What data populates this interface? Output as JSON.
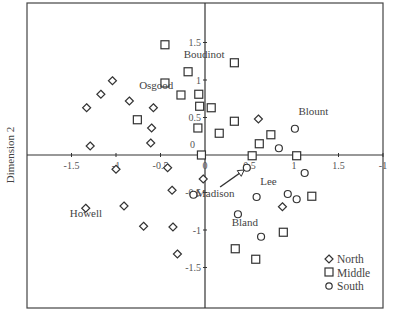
{
  "chart_data": {
    "type": "scatter",
    "title": "",
    "xlabel": "",
    "ylabel": "Dimension 2",
    "xlim": [
      -2,
      2
    ],
    "ylim": [
      -2,
      2
    ],
    "grid": false,
    "axes_through_origin": true,
    "x_ticks": [
      "-1.5",
      "-1",
      "-0.5",
      "0",
      "0.5",
      "1",
      "1.5",
      "-1"
    ],
    "x_tick_values": [
      -1.5,
      -1,
      -0.5,
      0,
      0.5,
      1,
      1.5,
      2
    ],
    "y_ticks": [
      "1.5",
      "1",
      "0.5",
      "0",
      "-0.5",
      "-1",
      "-1.5"
    ],
    "y_tick_values": [
      1.5,
      1,
      0.5,
      0,
      -0.5,
      -1,
      -1.5
    ],
    "legend_position": "lower right",
    "series": [
      {
        "name": "North",
        "marker": "diamond",
        "points": [
          [
            -1.04,
            0.99
          ],
          [
            -1.17,
            0.81
          ],
          [
            -1.33,
            0.63
          ],
          [
            -0.85,
            0.72
          ],
          [
            -0.58,
            0.63
          ],
          [
            -0.6,
            0.36
          ],
          [
            -0.61,
            0.16
          ],
          [
            -1.29,
            0.12
          ],
          [
            0.6,
            0.48
          ],
          [
            -1.0,
            -0.19
          ],
          [
            -0.42,
            -0.17
          ],
          [
            -0.02,
            -0.32
          ],
          [
            -0.37,
            -0.47
          ],
          [
            -1.34,
            -0.71
          ],
          [
            -0.91,
            -0.68
          ],
          [
            -0.69,
            -0.95
          ],
          [
            -0.36,
            -0.96
          ],
          [
            -0.31,
            -1.32
          ],
          [
            0.87,
            -0.69
          ]
        ]
      },
      {
        "name": "Middle",
        "marker": "square",
        "points": [
          [
            -0.45,
            1.47
          ],
          [
            -0.19,
            1.11
          ],
          [
            -0.45,
            0.96
          ],
          [
            -0.27,
            0.8
          ],
          [
            -0.07,
            0.81
          ],
          [
            -0.06,
            0.65
          ],
          [
            0.07,
            0.63
          ],
          [
            0.33,
            1.23
          ],
          [
            0.33,
            0.45
          ],
          [
            -0.08,
            0.36
          ],
          [
            0.16,
            0.29
          ],
          [
            -0.76,
            0.47
          ],
          [
            -0.04,
            0.0
          ],
          [
            0.53,
            -0.01
          ],
          [
            1.03,
            -0.01
          ],
          [
            0.74,
            0.27
          ],
          [
            0.61,
            0.15
          ],
          [
            1.2,
            -0.55
          ],
          [
            0.88,
            -1.03
          ],
          [
            0.34,
            -1.25
          ],
          [
            0.57,
            -1.39
          ]
        ]
      },
      {
        "name": "South",
        "marker": "circle",
        "points": [
          [
            1.01,
            0.35
          ],
          [
            0.83,
            0.09
          ],
          [
            1.12,
            -0.24
          ],
          [
            0.47,
            -0.17
          ],
          [
            -0.13,
            -0.53
          ],
          [
            0.58,
            -0.56
          ],
          [
            0.93,
            -0.52
          ],
          [
            1.03,
            -0.59
          ],
          [
            0.37,
            -0.79
          ],
          [
            0.63,
            -1.09
          ]
        ]
      }
    ],
    "annotations": [
      {
        "text": "Boudinot",
        "x": -0.24,
        "y": 1.3
      },
      {
        "text": "Osgood",
        "x": -0.74,
        "y": 0.88
      },
      {
        "text": "Blount",
        "x": 1.05,
        "y": 0.53
      },
      {
        "text": "Madison",
        "x": -0.1,
        "y": -0.56,
        "arrow_to": [
          0.44,
          -0.2
        ]
      },
      {
        "text": "Lee",
        "x": 0.62,
        "y": -0.4
      },
      {
        "text": "Bland",
        "x": 0.3,
        "y": -0.95
      },
      {
        "text": "Howell",
        "x": -1.52,
        "y": -0.83
      }
    ]
  },
  "legend": {
    "items": [
      {
        "label": "North",
        "marker": "diamond"
      },
      {
        "label": "Middle",
        "marker": "square"
      },
      {
        "label": "South",
        "marker": "circle"
      }
    ]
  },
  "axis": {
    "ylabel": "Dimension 2"
  },
  "colors": {
    "marker_stroke": "#333333",
    "axis": "#333333",
    "text": "#444444"
  }
}
